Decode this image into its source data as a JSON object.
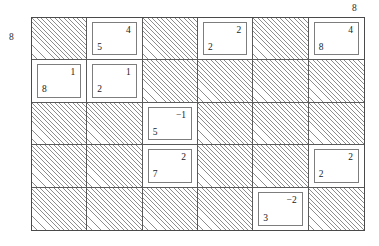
{
  "figure": {
    "type": "grid-diagram",
    "rows": 5,
    "columns": 6,
    "external_labels": {
      "left": "8",
      "top_right": "8"
    },
    "cells": [
      {
        "row": 1,
        "col": 1,
        "state": "hatched",
        "main": "",
        "corner": ""
      },
      {
        "row": 1,
        "col": 2,
        "state": "filled",
        "main": "5",
        "corner": "4"
      },
      {
        "row": 1,
        "col": 3,
        "state": "hatched",
        "main": "",
        "corner": ""
      },
      {
        "row": 1,
        "col": 4,
        "state": "filled",
        "main": "2",
        "corner": "2"
      },
      {
        "row": 1,
        "col": 5,
        "state": "hatched",
        "main": "",
        "corner": ""
      },
      {
        "row": 1,
        "col": 6,
        "state": "filled",
        "main": "8",
        "corner": "4"
      },
      {
        "row": 2,
        "col": 1,
        "state": "filled",
        "main": "8",
        "corner": "1"
      },
      {
        "row": 2,
        "col": 2,
        "state": "filled",
        "main": "2",
        "corner": "1"
      },
      {
        "row": 2,
        "col": 3,
        "state": "hatched",
        "main": "",
        "corner": ""
      },
      {
        "row": 2,
        "col": 4,
        "state": "hatched",
        "main": "",
        "corner": ""
      },
      {
        "row": 2,
        "col": 5,
        "state": "hatched",
        "main": "",
        "corner": ""
      },
      {
        "row": 2,
        "col": 6,
        "state": "hatched",
        "main": "",
        "corner": ""
      },
      {
        "row": 3,
        "col": 1,
        "state": "hatched",
        "main": "",
        "corner": ""
      },
      {
        "row": 3,
        "col": 2,
        "state": "hatched",
        "main": "",
        "corner": ""
      },
      {
        "row": 3,
        "col": 3,
        "state": "filled",
        "main": "5",
        "corner": "−1"
      },
      {
        "row": 3,
        "col": 4,
        "state": "hatched",
        "main": "",
        "corner": ""
      },
      {
        "row": 3,
        "col": 5,
        "state": "hatched",
        "main": "",
        "corner": ""
      },
      {
        "row": 3,
        "col": 6,
        "state": "hatched",
        "main": "",
        "corner": ""
      },
      {
        "row": 4,
        "col": 1,
        "state": "hatched",
        "main": "",
        "corner": ""
      },
      {
        "row": 4,
        "col": 2,
        "state": "hatched",
        "main": "",
        "corner": ""
      },
      {
        "row": 4,
        "col": 3,
        "state": "filled",
        "main": "7",
        "corner": "2"
      },
      {
        "row": 4,
        "col": 4,
        "state": "hatched",
        "main": "",
        "corner": ""
      },
      {
        "row": 4,
        "col": 5,
        "state": "hatched",
        "main": "",
        "corner": ""
      },
      {
        "row": 4,
        "col": 6,
        "state": "filled",
        "main": "2",
        "corner": "2"
      },
      {
        "row": 5,
        "col": 1,
        "state": "hatched",
        "main": "",
        "corner": ""
      },
      {
        "row": 5,
        "col": 2,
        "state": "hatched",
        "main": "",
        "corner": ""
      },
      {
        "row": 5,
        "col": 3,
        "state": "hatched",
        "main": "",
        "corner": ""
      },
      {
        "row": 5,
        "col": 4,
        "state": "hatched",
        "main": "",
        "corner": ""
      },
      {
        "row": 5,
        "col": 5,
        "state": "filled",
        "main": "3",
        "corner": "−2"
      },
      {
        "row": 5,
        "col": 6,
        "state": "hatched",
        "main": "",
        "corner": ""
      }
    ]
  }
}
